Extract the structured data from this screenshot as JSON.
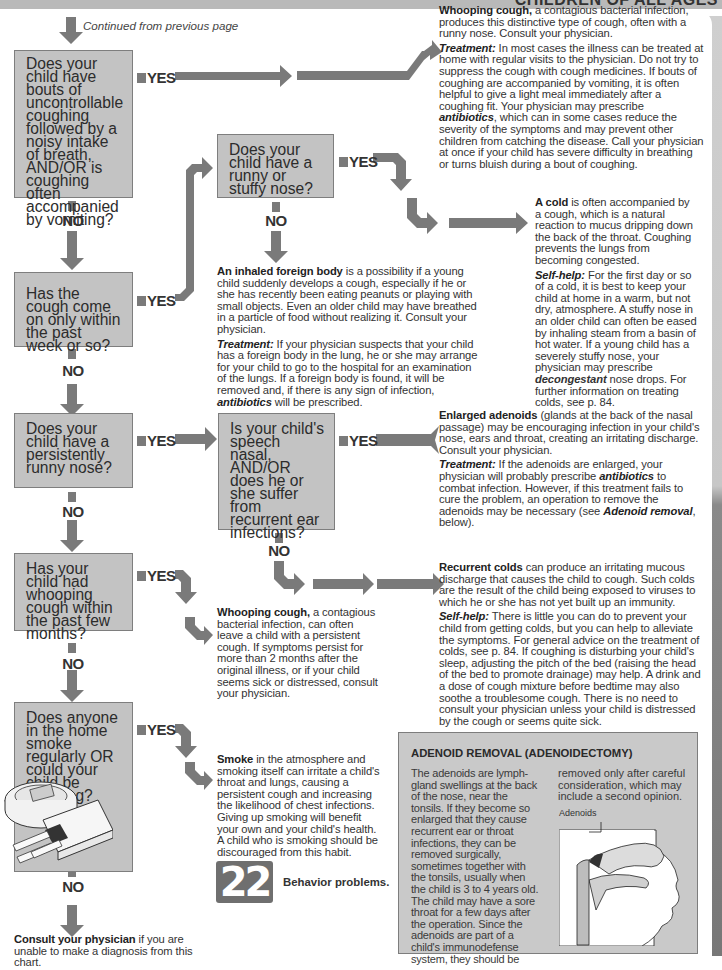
{
  "header": {
    "running_title": "CHILDREN OF ALL AGES"
  },
  "continued": "Continued from previous page",
  "labels": {
    "yes": "YES",
    "no": "NO"
  },
  "questions": [
    {
      "id": "q1",
      "text": "Does your child have bouts of uncontrollable coughing followed by a noisy intake of breath, AND/OR is coughing often accompanied by vomiting?"
    },
    {
      "id": "q2",
      "text": "Has the cough come on only within the past week or so?"
    },
    {
      "id": "q2a",
      "text": "Does your child have a runny or stuffy nose?"
    },
    {
      "id": "q3",
      "text": "Does your child have a persistently runny nose?"
    },
    {
      "id": "q3a",
      "text": "Is your child's speech nasal, AND/OR does he or she suffer from recurrent ear infections?"
    },
    {
      "id": "q4",
      "text": "Has your child had whooping cough within the past few months?"
    },
    {
      "id": "q5",
      "text": "Does anyone in the home smoke regularly OR could your child be smoking?"
    }
  ],
  "outcomes": {
    "whooping": {
      "lead": "Whooping cough,",
      "body": " a contagious bacterial infection, produces this distinctive type of cough, often with a runny nose. Consult your physician.",
      "t_label": "Treatment:",
      "t_body1": " In most cases the illness can be treated at home with regular visits to the physician. Do not try to suppress the cough with cough medicines. If bouts of coughing are accompanied by vomiting, it is often helpful to give a light meal immediately after a coughing fit. Your physician may prescribe ",
      "t_em": "antibiotics",
      "t_body2": ", which can in some cases reduce the severity of the symptoms and may prevent other children from catching the disease. Call your physician at once if your child has severe difficulty in breathing or turns bluish during a bout of coughing."
    },
    "cold": {
      "lead": "A cold",
      "body": " is often accompanied by a cough, which is a natural reaction to mucus dripping down the back of the throat. Coughing prevents the lungs from becoming congested.",
      "s_label": "Self-help:",
      "s_body1": " For the first day or so of a cold, it is best to keep your child at home in a warm, but not dry, atmosphere. A stuffy nose in an older child can often be eased by inhaling steam from a basin of hot water. If a young child has a severely stuffy nose, your physician may prescribe ",
      "s_em": "decongestant",
      "s_body2": " nose drops. For further information on treating colds, see p. 84."
    },
    "foreign": {
      "lead": "An inhaled foreign body",
      "body": " is a possibility if a young child suddenly develops a cough, especially if he or she has recently been eating peanuts or playing with small objects. Even an older child may have breathed in a particle of food without realizing it. Consult your physician.",
      "t_label": "Treatment:",
      "t_body1": " If your physician suspects that your child has a foreign body in the lung, he or she may arrange for your child to go to the hospital for an examination of the lungs. If a foreign body is found, it will be removed and, if there is any sign of infection, ",
      "t_em": "antibiotics",
      "t_body2": " will be prescribed."
    },
    "adenoids": {
      "lead": "Enlarged adenoids",
      "body": " (glands at the back of the nasal passage) may be encouraging infection in your child's nose, ears and throat, creating an irritating discharge. Consult your physician.",
      "t_label": "Treatment:",
      "t_body1": " If the adenoids are enlarged, your physician will probably prescribe ",
      "t_em": "antibiotics",
      "t_body2": " to combat infection. However, if this treatment fails to cure the problem, an operation to remove the adenoids may be necessary (see ",
      "t_em2": "Adenoid removal",
      "t_body3": ", below)."
    },
    "recurrent": {
      "lead": "Recurrent colds",
      "body": " can produce an irritating mucous discharge that causes the child to cough. Such colds are the result of the child being exposed to viruses to which he or she has not yet built up an immunity.",
      "s_label": "Self-help:",
      "s_body": " There is little you can do to prevent your child from getting colds, but you can help to alleviate the symptoms. For general advice on the treatment of colds, see p. 84. If coughing is disturbing your child's sleep, adjusting the pitch of the bed (raising the head of the bed to promote drainage) may help. A drink and a dose of cough mixture before bedtime may also soothe a troublesome cough. There is no need to consult your physician unless your child is distressed by the cough or seems quite sick."
    },
    "whooping_after": {
      "lead": "Whooping cough,",
      "body": " a contagious bacterial infection, can often leave a child with a persistent cough. If symptoms persist for more than 2 months after the original illness, or if your child seems sick or distressed, consult your physician."
    },
    "smoke": {
      "lead": "Smoke",
      "body": " in the atmosphere and smoking itself can irritate a child's throat and lungs, causing a persistent cough and increasing the likelihood of chest infections. Giving up smoking will benefit your own and your child's health. A child who is smoking should be discouraged from this habit.",
      "goto": "Go to chart",
      "chart_number": "22",
      "chart_title": "Behavior problems."
    },
    "consult": {
      "lead": "Consult your physician",
      "body": " if you are unable to make a diagnosis from this chart."
    }
  },
  "sidebar": {
    "title": "ADENOID REMOVAL (ADENOIDECTOMY)",
    "col1": "The adenoids are lymph-gland swellings at the back of the nose, near the tonsils. If they become so enlarged that they cause recurrent ear or throat infections, they can be removed surgically, sometimes together with the tonsils, usually when the child is 3 to 4 years old. The child may have a sore throat for a few days after the operation. Since the adenoids are part of a child's immunodefense system, they should be",
    "col2": "removed only after careful consideration, which may include a second opinion.",
    "illustration_label": "Adenoids"
  },
  "colors": {
    "box": "#c3c3c3",
    "arrow": "#7a7a7a",
    "band": "#b9b9b9"
  }
}
